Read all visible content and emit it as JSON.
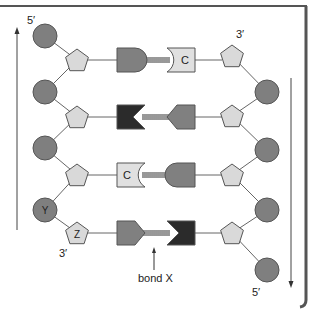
{
  "diagram": {
    "colors": {
      "phosphate": "#7f7f7f",
      "sugar": "#d9d9d9",
      "base_dark": "#2b2b2b",
      "base_mid": "#808080",
      "base_c": "#e0e0e0",
      "outline": "#555555",
      "frame": "#555555"
    },
    "left_strand": {
      "top_label": "5′",
      "bottom_label": "3′",
      "direction": "up",
      "phosphate_labels": [
        "",
        "",
        "",
        "Y"
      ],
      "sugar_labels": [
        "",
        "",
        "",
        "Z"
      ]
    },
    "right_strand": {
      "top_label": "3′",
      "bottom_label": "5′",
      "direction": "down"
    },
    "base_pairs": [
      {
        "left": {
          "shape": "round",
          "shade": "mid",
          "label": ""
        },
        "right": {
          "shape": "cup",
          "shade": "c",
          "label": "C"
        }
      },
      {
        "left": {
          "shape": "notch",
          "shade": "dark",
          "label": ""
        },
        "right": {
          "shape": "point",
          "shade": "mid",
          "label": ""
        }
      },
      {
        "left": {
          "shape": "cup",
          "shade": "c",
          "label": "C"
        },
        "right": {
          "shape": "round",
          "shade": "mid",
          "label": ""
        }
      },
      {
        "left": {
          "shape": "point",
          "shade": "mid",
          "label": ""
        },
        "right": {
          "shape": "notch",
          "shade": "dark",
          "label": ""
        }
      }
    ],
    "bond_label": "bond X"
  }
}
